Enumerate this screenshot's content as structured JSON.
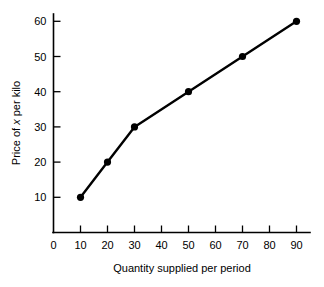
{
  "chart_data": {
    "type": "line",
    "title": "",
    "xlabel": "Quantity supplied per period",
    "ylabel_parts": [
      "Price of ",
      "x",
      " per kilo"
    ],
    "ylabel": "Price of x per kilo",
    "x": [
      10,
      20,
      30,
      50,
      70,
      90
    ],
    "values": [
      10,
      20,
      30,
      40,
      50,
      60
    ],
    "series": [
      {
        "name": "Supply",
        "points": [
          {
            "x": 10,
            "y": 10
          },
          {
            "x": 20,
            "y": 20
          },
          {
            "x": 30,
            "y": 30
          },
          {
            "x": 50,
            "y": 40
          },
          {
            "x": 70,
            "y": 50
          },
          {
            "x": 90,
            "y": 60
          }
        ]
      }
    ],
    "xlim": [
      0,
      95
    ],
    "ylim": [
      0,
      65
    ],
    "xticks": [
      0,
      10,
      20,
      30,
      40,
      50,
      60,
      70,
      80,
      90
    ],
    "yticks": [
      10,
      20,
      30,
      40,
      50,
      60
    ],
    "xtick_labels": [
      "0",
      "10",
      "20",
      "30",
      "40",
      "50",
      "60",
      "70",
      "80",
      "90"
    ],
    "ytick_labels": [
      "10",
      "20",
      "30",
      "40",
      "50",
      "60"
    ],
    "grid": false,
    "legend": "none",
    "marker": "filled-circle",
    "line_color": "#000000",
    "marker_color": "#000000",
    "background_color": "#ffffff"
  },
  "axes": {
    "x_axis_name": "quantity-axis",
    "y_axis_name": "price-axis"
  }
}
